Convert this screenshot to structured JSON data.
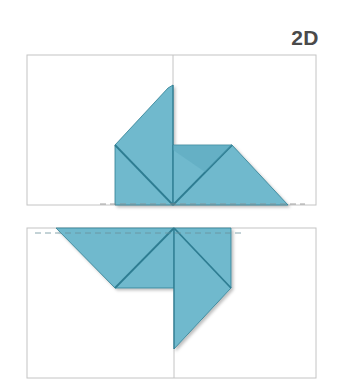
{
  "step": {
    "label": "2D"
  },
  "colors": {
    "paper_fill": "#6fb9cd",
    "paper_fill_shade": "#5aa8be",
    "fold_line": "#2e7d92",
    "frame": "#bdbdbd",
    "guide_dashes": "#9a9a9a"
  },
  "panels": [
    {
      "name": "top-panel",
      "description": "Paper folded upward: left flap rising to a point at the center crease, right flap folded into a trapezoid along the baseline"
    },
    {
      "name": "bottom-panel",
      "description": "Mirror view: left flap hanging from top edge as a parallelogram, right flap descending to a point along the center crease"
    }
  ]
}
